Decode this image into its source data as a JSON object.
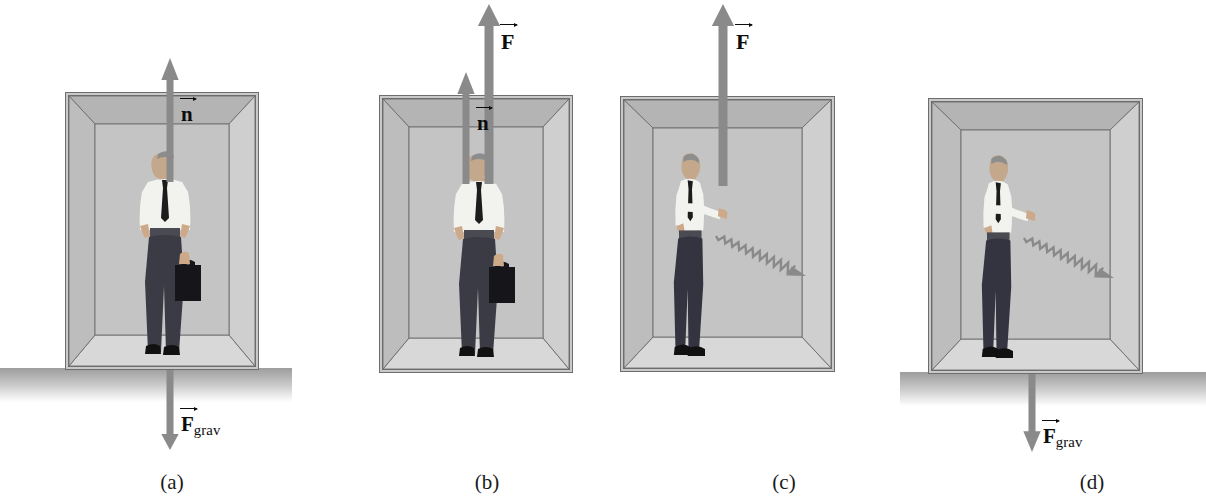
{
  "figure": {
    "type": "physics-free-body-diagram",
    "colors": {
      "arrow_gray": "#8a8a8a",
      "box_fill": "#c9c9c9",
      "box_line": "#6d6d6d",
      "ground_dark": "#9d9d9d",
      "label_black": "#0c0c0c"
    }
  },
  "panels": [
    {
      "id": "a",
      "caption": "(a)",
      "caption_x": 172,
      "caption_y": 470,
      "on_ground": true,
      "ground": {
        "x": 0,
        "y": 368,
        "width": 292,
        "height": 34
      },
      "box": {
        "x": 65,
        "y": 92,
        "width": 194,
        "height": 278
      },
      "man": {
        "x": 128,
        "y": 150,
        "width": 74,
        "height": 205,
        "holds_briefcase": true,
        "pose": "front"
      },
      "arrows": [
        {
          "name": "normal-force",
          "label": "n",
          "label_vector": true,
          "subscript": "",
          "direction": "up",
          "x": 170,
          "y_tip": 58,
          "y_tail": 182,
          "width": 7,
          "label_x": 181,
          "label_y": 104,
          "label_size": 21
        },
        {
          "name": "gravity-force",
          "label": "F",
          "label_vector": true,
          "subscript": "grav",
          "direction": "down",
          "x": 170,
          "y_tail": 370,
          "y_tip": 450,
          "width": 7,
          "label_x": 181,
          "label_y": 414,
          "label_size": 21
        }
      ],
      "wavy_arrow": null
    },
    {
      "id": "b",
      "caption": "(b)",
      "caption_x": 487,
      "caption_y": 470,
      "on_ground": false,
      "ground": null,
      "box": {
        "x": 379,
        "y": 95,
        "width": 194,
        "height": 278
      },
      "man": {
        "x": 442,
        "y": 152,
        "width": 74,
        "height": 205,
        "holds_briefcase": true,
        "pose": "front"
      },
      "arrows": [
        {
          "name": "normal-force",
          "label": "n",
          "label_vector": true,
          "subscript": "",
          "direction": "up",
          "x": 466,
          "y_tip": 72,
          "y_tail": 184,
          "width": 7,
          "label_x": 477,
          "label_y": 113,
          "label_size": 21
        },
        {
          "name": "applied-force",
          "label": "F",
          "label_vector": true,
          "subscript": "",
          "direction": "up",
          "x": 489,
          "y_tip": 4,
          "y_tail": 184,
          "width": 9,
          "label_x": 501,
          "label_y": 31,
          "label_size": 22
        }
      ],
      "wavy_arrow": null
    },
    {
      "id": "c",
      "caption": "(c)",
      "caption_x": 784,
      "caption_y": 470,
      "on_ground": false,
      "ground": null,
      "box": {
        "x": 620,
        "y": 96,
        "width": 215,
        "height": 276
      },
      "man": {
        "x": 660,
        "y": 150,
        "width": 64,
        "height": 206,
        "holds_briefcase": false,
        "pose": "side"
      },
      "arrows": [
        {
          "name": "applied-force",
          "label": "F",
          "label_vector": true,
          "subscript": "",
          "direction": "up",
          "x": 723,
          "y_tip": 4,
          "y_tail": 186,
          "width": 9,
          "label_x": 736,
          "label_y": 31,
          "label_size": 22
        }
      ],
      "wavy_arrow": {
        "name": "falling-briefcase-path",
        "x1": 716,
        "y1": 236,
        "x2": 806,
        "y2": 276,
        "amplitude": 5,
        "cycles": 11
      }
    },
    {
      "id": "d",
      "caption": "(d)",
      "caption_x": 1092,
      "caption_y": 470,
      "on_ground": true,
      "ground": {
        "x": 900,
        "y": 372,
        "width": 306,
        "height": 34
      },
      "box": {
        "x": 928,
        "y": 98,
        "width": 215,
        "height": 276
      },
      "man": {
        "x": 968,
        "y": 152,
        "width": 64,
        "height": 206,
        "holds_briefcase": false,
        "pose": "side"
      },
      "arrows": [
        {
          "name": "gravity-force",
          "label": "F",
          "label_vector": true,
          "subscript": "grav",
          "direction": "down",
          "x": 1032,
          "y_tail": 348,
          "y_tip": 452,
          "width": 7,
          "label_x": 1043,
          "label_y": 426,
          "label_size": 21
        }
      ],
      "wavy_arrow": {
        "name": "falling-briefcase-path",
        "x1": 1024,
        "y1": 238,
        "x2": 1114,
        "y2": 278,
        "amplitude": 5,
        "cycles": 11
      }
    }
  ]
}
